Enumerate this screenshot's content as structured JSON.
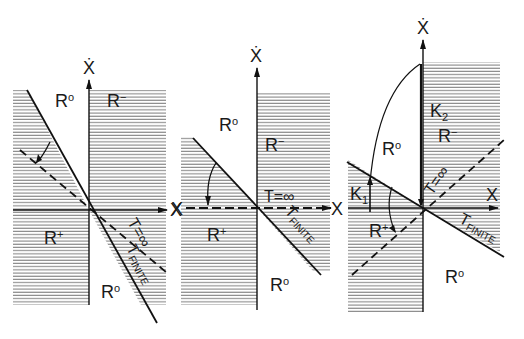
{
  "figure": {
    "panels": [
      {
        "id": "panel-1",
        "axes": {
          "x_label": "X",
          "y_label": "Ẋ"
        },
        "regions": [
          {
            "label": "R",
            "sup": "o",
            "position": "upper-left"
          },
          {
            "label": "R",
            "sup": "−",
            "position": "upper-right"
          },
          {
            "label": "R",
            "sup": "+",
            "position": "lower-left"
          },
          {
            "label": "R",
            "sup": "o",
            "position": "lower-right"
          }
        ],
        "lines": [
          {
            "label": "T=∞",
            "style": "dashed"
          },
          {
            "label": "T",
            "sub": "FINITE",
            "style": "solid"
          }
        ]
      },
      {
        "id": "panel-2",
        "axes": {
          "x_label": "X",
          "x_label_left": "X",
          "y_label": "Ẋ"
        },
        "regions": [
          {
            "label": "R",
            "sup": "o",
            "position": "upper-left"
          },
          {
            "label": "R",
            "sup": "−",
            "position": "upper-right"
          },
          {
            "label": "R",
            "sup": "+",
            "position": "lower-left"
          },
          {
            "label": "R",
            "sup": "o",
            "position": "lower-right"
          }
        ],
        "lines": [
          {
            "label": "T=∞",
            "style": "dashed"
          },
          {
            "label": "T",
            "sub": "FINITE",
            "style": "solid"
          }
        ]
      },
      {
        "id": "panel-3",
        "axes": {
          "x_label": "X",
          "y_label": "Ẋ"
        },
        "regions": [
          {
            "label": "R",
            "sup": "o",
            "position": "upper-left"
          },
          {
            "label": "R",
            "sup": "−",
            "position": "upper-right"
          },
          {
            "label": "R",
            "sup": "+",
            "position": "lower-left"
          },
          {
            "label": "R",
            "sup": "o",
            "position": "lower-right"
          }
        ],
        "gains": [
          {
            "label": "K",
            "sub": "1"
          },
          {
            "label": "K",
            "sub": "2"
          }
        ],
        "lines": [
          {
            "label": "T=∞",
            "style": "dashed"
          },
          {
            "label": "T",
            "sub": "FINITE",
            "style": "solid"
          }
        ]
      }
    ]
  }
}
